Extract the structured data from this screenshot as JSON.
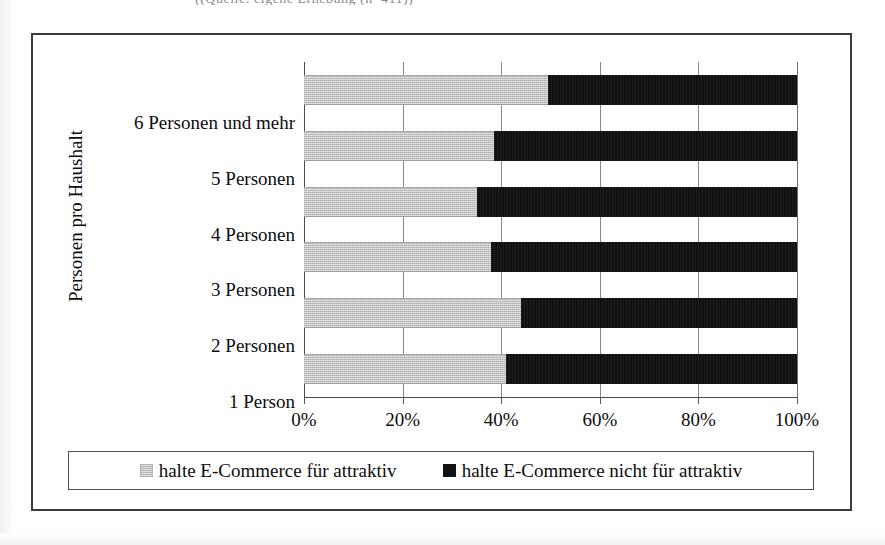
{
  "top_caption": "((Quelle: eigene Erhebung (n=411))",
  "chart_data": {
    "type": "bar",
    "orientation": "horizontal",
    "stacked": true,
    "normalized_percent": true,
    "title": "",
    "xlabel": "",
    "ylabel": "Personen pro Haushalt",
    "xlim": [
      0,
      100
    ],
    "grid": true,
    "legend_position": "bottom",
    "x_tick_labels": [
      "0%",
      "20%",
      "40%",
      "60%",
      "80%",
      "100%"
    ],
    "x_tick_values": [
      0,
      20,
      40,
      60,
      80,
      100
    ],
    "categories": [
      "6 Personen und mehr",
      "5 Personen",
      "4 Personen",
      "3 Personen",
      "2 Personen",
      "1 Person"
    ],
    "series": [
      {
        "name": "halte E-Commerce für attraktiv",
        "color": "#c3c3c3",
        "values": [
          49.5,
          38.5,
          35.0,
          38.0,
          44.0,
          41.0
        ]
      },
      {
        "name": "halte E-Commerce nicht für attraktiv",
        "color": "#111111",
        "values": [
          50.5,
          61.5,
          65.0,
          62.0,
          56.0,
          59.0
        ]
      }
    ]
  },
  "legend": {
    "entries": [
      {
        "label": "halte E-Commerce für attraktiv",
        "swatch": "light-gray-swatch"
      },
      {
        "label": "halte E-Commerce nicht für attraktiv",
        "swatch": "black-swatch"
      }
    ]
  }
}
